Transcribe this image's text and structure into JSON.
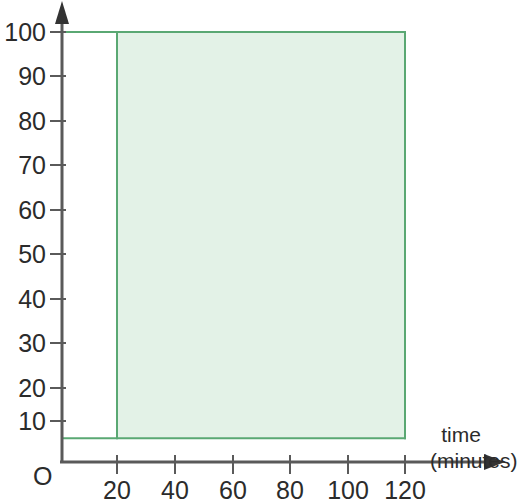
{
  "chart_data": {
    "type": "area",
    "title": "",
    "xlabel": "time (minutes)",
    "ylabel": "(cut off at top of image)",
    "xlim": [
      0,
      130
    ],
    "ylim": [
      0,
      103
    ],
    "grid": false,
    "legend": "none",
    "origin_label": "O",
    "x_ticks": [
      20,
      40,
      60,
      80,
      100,
      120
    ],
    "x_tick_labels": [
      "20",
      "40",
      "60",
      "80",
      "100",
      "120"
    ],
    "y_ticks": [
      10,
      20,
      30,
      40,
      50,
      60,
      70,
      80,
      90,
      100
    ],
    "y_tick_labels": [
      "10",
      "20",
      "30",
      "40",
      "50",
      "60",
      "70",
      "80",
      "90",
      "100"
    ],
    "shaded_region": {
      "x_start": 20,
      "x_end": 120,
      "y_bottom": 6,
      "y_top": 100,
      "fill_color": "#e3f2e7",
      "border_color": "#5aa873"
    },
    "reference_lines": [
      {
        "orientation": "horizontal",
        "value": 100,
        "x_from": 0,
        "x_to": 120,
        "color": "#5aa873"
      },
      {
        "orientation": "horizontal",
        "value": 6,
        "x_from": 0,
        "x_to": 120,
        "color": "#5aa873"
      },
      {
        "orientation": "vertical",
        "value": 20,
        "y_from": 6,
        "y_to": 100,
        "color": "#5aa873"
      },
      {
        "orientation": "vertical",
        "value": 120,
        "y_from": 6,
        "y_to": 100,
        "color": "#5aa873"
      }
    ],
    "series": [
      {
        "name": "shaded-solution-region",
        "x": [
          20,
          20,
          120,
          120,
          20
        ],
        "values": [
          6,
          100,
          100,
          6,
          6
        ]
      }
    ]
  },
  "axes": {
    "x_axis_color": "#5a5a5a",
    "y_axis_color": "#5a5a5a",
    "arrow_style": "filled-triangle"
  },
  "xaxis_title_lines": [
    "time",
    "(minutes)"
  ]
}
